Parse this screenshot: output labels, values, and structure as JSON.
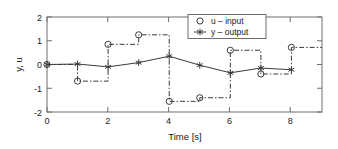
{
  "chart_data": {
    "type": "line",
    "title": "",
    "xlabel": "Time [s]",
    "ylabel": "y, u",
    "xlim": [
      0,
      9
    ],
    "ylim": [
      -2,
      2
    ],
    "xticks": [
      0,
      2,
      4,
      6,
      8
    ],
    "xtick_labels": [
      "0",
      "2",
      "4",
      "6",
      "8"
    ],
    "yticks": [
      -2,
      -1,
      0,
      1,
      2
    ],
    "ytick_labels": [
      "-2",
      "-1",
      "0",
      "1",
      "2"
    ],
    "grid": false,
    "legend_position": "top-right",
    "series": [
      {
        "name": "u - input",
        "marker": "circle",
        "linestyle": "dash-dot",
        "drawstyle": "steps-post",
        "x": [
          0,
          1,
          2,
          3,
          4,
          5,
          6,
          7,
          8
        ],
        "values": [
          0.0,
          -0.7,
          0.85,
          1.25,
          -1.55,
          -1.4,
          0.6,
          -0.4,
          0.72
        ]
      },
      {
        "name": "y - output",
        "marker": "star",
        "linestyle": "solid",
        "drawstyle": "default",
        "x": [
          0,
          1,
          2,
          3,
          4,
          5,
          6,
          7,
          8
        ],
        "values": [
          0.0,
          0.02,
          -0.1,
          0.08,
          0.35,
          -0.03,
          -0.35,
          -0.15,
          -0.22
        ]
      }
    ]
  },
  "legend": {
    "entries": [
      {
        "label": "u – input",
        "marker": "circle-icon"
      },
      {
        "label": "y – output",
        "marker": "star-line-icon"
      }
    ]
  },
  "axes": {
    "xlabel": "Time [s]",
    "ylabel": "y, u",
    "xtick_labels": [
      "0",
      "2",
      "4",
      "6",
      "8"
    ],
    "ytick_labels": [
      "2",
      "1",
      "0",
      "-1",
      "-2"
    ]
  },
  "colors": {
    "line": "#3a3a3a",
    "axis": "#6e6e6e",
    "text": "#1a1a1a",
    "background": "#ffffff"
  }
}
